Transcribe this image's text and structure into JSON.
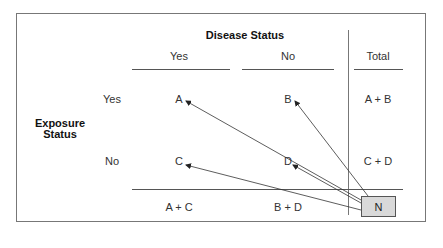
{
  "header": {
    "disease_status": "Disease Status",
    "col_yes": "Yes",
    "col_no": "No",
    "col_total": "Total"
  },
  "row_header": {
    "line1": "Exposure",
    "line2": "Status",
    "row_yes": "Yes",
    "row_no": "No"
  },
  "cells": {
    "a": "A",
    "b": "B",
    "c": "C",
    "d": "D",
    "a_plus_b": "A + B",
    "c_plus_d": "C + D",
    "a_plus_c": "A + C",
    "b_plus_d": "B + D",
    "n": "N"
  },
  "colors": {
    "n_box_fill": "#d9d9d9",
    "lines": "#555555"
  }
}
